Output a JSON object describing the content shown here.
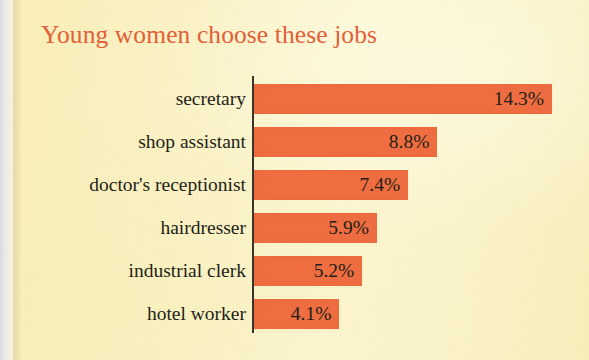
{
  "chart_data": {
    "type": "bar",
    "orientation": "horizontal",
    "title": "Young women choose these jobs",
    "xlabel": "",
    "ylabel": "",
    "categories": [
      "secretary",
      "shop assistant",
      "doctor's receptionist",
      "hairdresser",
      "industrial clerk",
      "hotel worker"
    ],
    "values": [
      14.3,
      8.8,
      7.4,
      5.9,
      5.2,
      4.1
    ],
    "value_labels": [
      "14.3%",
      "8.8%",
      "7.4%",
      "5.9%",
      "5.2%",
      "4.1%"
    ],
    "unit": "%",
    "xlim": [
      0,
      14.3
    ],
    "grid": false,
    "legend": null,
    "axis_visible": {
      "x": false,
      "y": true
    }
  },
  "colors": {
    "background": "#fbf2c4",
    "bar": "#ef6e42",
    "title": "#e25f39",
    "label_text": "#231f17",
    "axis": "#3a3326",
    "page_edge": "#dcdcda"
  },
  "bars": [
    {
      "category": "secretary",
      "value": 14.3,
      "label": "14.3%"
    },
    {
      "category": "shop assistant",
      "value": 8.8,
      "label": "8.8%"
    },
    {
      "category": "doctor's receptionist",
      "value": 7.4,
      "label": "7.4%"
    },
    {
      "category": "hairdresser",
      "value": 5.9,
      "label": "5.9%"
    },
    {
      "category": "industrial clerk",
      "value": 5.2,
      "label": "5.2%"
    },
    {
      "category": "hotel worker",
      "value": 4.1,
      "label": "4.1%"
    }
  ],
  "layout": {
    "bar_origin_x": 254,
    "px_per_percent": 20.84,
    "first_bar_top": 84,
    "bar_pitch": 43,
    "bar_height": 30
  }
}
